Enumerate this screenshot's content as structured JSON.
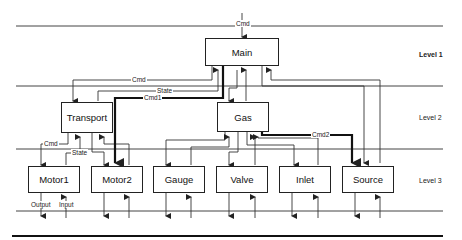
{
  "diagram": {
    "levels": [
      {
        "label": "Level 1"
      },
      {
        "label": "Level 2"
      },
      {
        "label": "Level 3"
      }
    ],
    "nodes": {
      "main": "Main",
      "transport": "Transport",
      "gas": "Gas",
      "motor1": "Motor1",
      "motor2": "Motor2",
      "gauge": "Gauge",
      "valve": "Valve",
      "inlet": "Inlet",
      "source": "Source"
    },
    "edge_labels": {
      "cmd_top": "Cmd",
      "cmd_transport": "Cmd",
      "state_transport": "State",
      "cmd1": "Cmd1",
      "cmd2": "Cmd2",
      "cmd_motor1": "Cmd",
      "state_motor1": "State",
      "output": "Output",
      "input": "Input"
    },
    "edges": [
      {
        "from": "external",
        "to": "Main",
        "label": "Cmd"
      },
      {
        "from": "Main",
        "to": "Transport",
        "label": "Cmd"
      },
      {
        "from": "Transport",
        "to": "Main",
        "label": "State"
      },
      {
        "from": "Main",
        "to": "Motor2",
        "label": "Cmd1",
        "emphasis": true
      },
      {
        "from": "Main",
        "to": "Gas"
      },
      {
        "from": "Gas",
        "to": "Main"
      },
      {
        "from": "Main",
        "to": "Source"
      },
      {
        "from": "Source",
        "to": "Main"
      },
      {
        "from": "Gas",
        "to": "Source",
        "label": "Cmd2",
        "emphasis": true
      },
      {
        "from": "Transport",
        "to": "Motor1",
        "label": "Cmd"
      },
      {
        "from": "Motor1",
        "to": "Transport",
        "label": "State"
      },
      {
        "from": "Transport",
        "to": "Motor2"
      },
      {
        "from": "Motor2",
        "to": "Transport"
      },
      {
        "from": "Gas",
        "to": "Gauge"
      },
      {
        "from": "Gauge",
        "to": "Gas"
      },
      {
        "from": "Gas",
        "to": "Valve"
      },
      {
        "from": "Valve",
        "to": "Gas"
      },
      {
        "from": "Gas",
        "to": "Inlet"
      },
      {
        "from": "Inlet",
        "to": "Gas"
      }
    ]
  }
}
